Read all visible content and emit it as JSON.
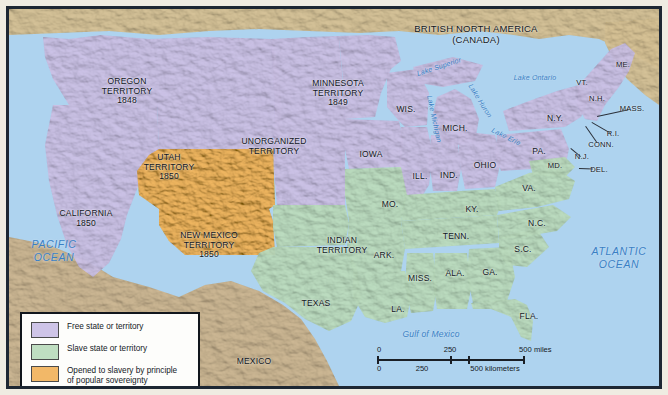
{
  "map": {
    "title_regions": {
      "canada": "BRITISH NORTH AMERICA\n(CANADA)",
      "mexico": "MEXICO"
    },
    "oceans": [
      {
        "name": "PACIFIC\nOCEAN",
        "x": 45,
        "y": 241
      },
      {
        "name": "ATLANTIC\nOCEAN",
        "x": 610,
        "y": 248
      }
    ],
    "seas": [
      {
        "name": "Gulf of Mexico",
        "x": 422,
        "y": 326
      }
    ],
    "lakes": [
      {
        "name": "Lake Superior",
        "x": 430,
        "y": 58,
        "rot": -18
      },
      {
        "name": "Lake Michigan",
        "x": 425,
        "y": 110,
        "rot": 78
      },
      {
        "name": "Lake Huron",
        "x": 471,
        "y": 92,
        "rot": 58
      },
      {
        "name": "Lake Erie",
        "x": 497,
        "y": 128,
        "rot": 27
      },
      {
        "name": "Lake Ontario",
        "x": 526,
        "y": 69,
        "rot": 0
      }
    ],
    "free_regions": [
      {
        "label": "OREGON\nTERRITORY\n1848",
        "x": 118,
        "y": 82
      },
      {
        "label": "UNORGANIZED\nTERRITORY",
        "x": 265,
        "y": 137
      },
      {
        "label": "MINNESOTA\nTERRITORY\n1849",
        "x": 329,
        "y": 84
      },
      {
        "label": "CALIFORNIA\n1850",
        "x": 77,
        "y": 209
      },
      {
        "label": "IOWA",
        "x": 362,
        "y": 146
      },
      {
        "label": "WIS.",
        "x": 397,
        "y": 101
      },
      {
        "label": "MICH.",
        "x": 446,
        "y": 120
      },
      {
        "label": "ILL.",
        "x": 411,
        "y": 168
      },
      {
        "label": "IND.",
        "x": 440,
        "y": 167
      },
      {
        "label": "OHIO",
        "x": 476,
        "y": 157
      },
      {
        "label": "N.Y.",
        "x": 546,
        "y": 110
      },
      {
        "label": "PA.",
        "x": 530,
        "y": 143
      },
      {
        "label": "ME.",
        "x": 614,
        "y": 56
      },
      {
        "label": "VT.",
        "x": 573,
        "y": 74
      },
      {
        "label": "N.H.",
        "x": 588,
        "y": 90
      }
    ],
    "free_leadered": [
      {
        "label": "MASS.",
        "x": 623,
        "y": 100,
        "lx": 588,
        "ly": 107
      },
      {
        "label": "R.I.",
        "x": 604,
        "y": 125,
        "lx": 583,
        "ly": 113
      },
      {
        "label": "CONN.",
        "x": 592,
        "y": 136,
        "lx": 577,
        "ly": 117
      },
      {
        "label": "N.J.",
        "x": 573,
        "y": 148,
        "lx": 562,
        "ly": 139
      }
    ],
    "slave_regions": [
      {
        "label": "INDIAN\nTERRITORY",
        "x": 333,
        "y": 236
      },
      {
        "label": "TEXAS",
        "x": 307,
        "y": 295
      },
      {
        "label": "MO.",
        "x": 381,
        "y": 196
      },
      {
        "label": "ARK.",
        "x": 375,
        "y": 247
      },
      {
        "label": "LA.",
        "x": 389,
        "y": 301
      },
      {
        "label": "MISS.",
        "x": 411,
        "y": 270
      },
      {
        "label": "ALA.",
        "x": 446,
        "y": 265
      },
      {
        "label": "TENN.",
        "x": 447,
        "y": 228
      },
      {
        "label": "KY.",
        "x": 463,
        "y": 201
      },
      {
        "label": "GA.",
        "x": 481,
        "y": 264
      },
      {
        "label": "S.C.",
        "x": 514,
        "y": 241
      },
      {
        "label": "N.C.",
        "x": 528,
        "y": 215
      },
      {
        "label": "VA.",
        "x": 520,
        "y": 180
      },
      {
        "label": "FLA.",
        "x": 520,
        "y": 308
      },
      {
        "label": "MD.",
        "x": 546,
        "y": 157
      }
    ],
    "slave_leadered": [
      {
        "label": "DEL.",
        "x": 590,
        "y": 161,
        "lx": 570,
        "ly": 159
      }
    ],
    "popsov_regions": [
      {
        "label": "UTAH\nTERRITORY\n1850",
        "x": 160,
        "y": 158
      },
      {
        "label": "NEW MEXICO\nTERRITORY\n1850",
        "x": 200,
        "y": 236
      }
    ]
  },
  "legend": {
    "items": [
      {
        "color": "#cec4e7",
        "label": "Free state or territory"
      },
      {
        "color": "#bfdec1",
        "label": "Slave state or territory"
      },
      {
        "color": "#f2b868",
        "label": "Opened to slavery by principle\nof popular sovereignty"
      }
    ]
  },
  "scale": {
    "miles": {
      "ticks": [
        "0",
        "250",
        "500 miles"
      ]
    },
    "kilometers": {
      "ticks": [
        "0",
        "250",
        "500 kilometers"
      ]
    }
  },
  "colors": {
    "free": "#cec4e7",
    "slave": "#bfdec1",
    "popular_sovereignty": "#f2b868",
    "foreign_land": "#d8c49a",
    "ocean": "#aed3ef",
    "border": "#1d2733"
  }
}
